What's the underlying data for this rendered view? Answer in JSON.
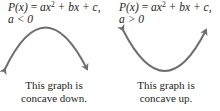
{
  "panels": [
    {
      "formula_lhs": "P(x)",
      "formula_eq": " = ",
      "formula_a": "ax",
      "formula_exp": "2",
      "formula_rest": " + bx + c,",
      "condition": "a < 0",
      "caption_line1": "This graph is",
      "caption_line2": "concave down.",
      "curve": "downward-parabola-with-arrows"
    },
    {
      "formula_lhs": "P(x)",
      "formula_eq": " = ",
      "formula_a": "ax",
      "formula_exp": "2",
      "formula_rest": " + bx + c,",
      "condition": "a > 0",
      "caption_line1": "This graph is",
      "caption_line2": "concave up.",
      "curve": "upward-parabola-with-arrows"
    }
  ],
  "colors": {
    "curve": "#6d6e71",
    "text": "#231f20"
  }
}
